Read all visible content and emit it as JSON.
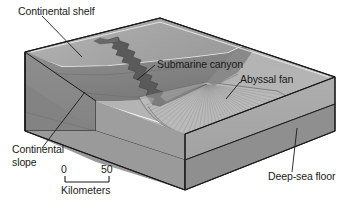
{
  "figure": {
    "kind": "block-diagram",
    "background_color": "#ffffff"
  },
  "labels": {
    "continental_shelf": "Continental shelf",
    "submarine_canyon": "Submarine canyon",
    "abyssal_fan": "Abyssal fan",
    "continental_slope": "Continental\nslope",
    "deep_sea_floor": "Deep-sea floor"
  },
  "scale_bar": {
    "min": "0",
    "max": "50",
    "units": "Kilometers"
  },
  "colors": {
    "shelf_surface": "#a9a9a9",
    "shelf_surface_light": "#bdbdbd",
    "slope_face": "#8a8a8a",
    "left_side_face": "#909090",
    "front_side_face": "#9a9a9a",
    "right_side_face": "#a0a0a0",
    "deep_sea_floor": "#b3b3b3",
    "abyssal_fan": "#b8b8b8",
    "canyon_dark": "#5d5d5d",
    "basement_layer": "#8d8d8d",
    "outline": "#1a1a1a",
    "label_text": "#1a1a1a",
    "highlight_line": "#f2f2f2"
  }
}
